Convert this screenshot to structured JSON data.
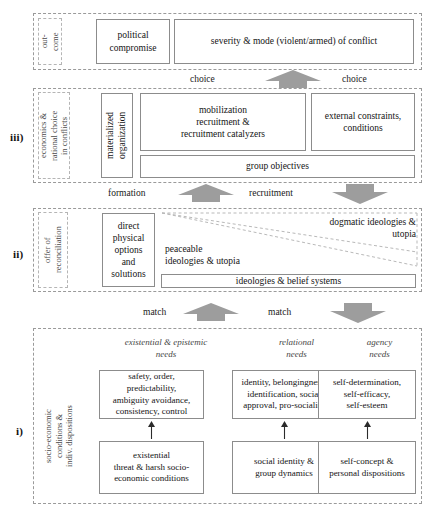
{
  "diagram": {
    "accent_arrow_color": "#9d9d9d",
    "band_border_color": "#9a9a9a",
    "box_border_color": "#8c8c8c"
  },
  "tiers": {
    "iii_label": "iii)",
    "ii_label": "ii)",
    "i_label": "i)"
  },
  "outcome": {
    "side_caption": "out-\ncome",
    "boxes": [
      {
        "id": "political-compromise",
        "label": "political\ncompromise"
      },
      {
        "id": "severity-mode",
        "label": "severity & mode (violent/armed) of conflict"
      }
    ]
  },
  "economics": {
    "side_caption": "economics &\nrational choice\nin conflicts",
    "boxes": [
      {
        "id": "materialized-organization",
        "label": "materialized\norganization"
      },
      {
        "id": "mobilization",
        "label": "mobilization\nrecruitment &\nrecruitment catalyzers"
      },
      {
        "id": "external-constraints",
        "label": "external constraints,\nconditions"
      },
      {
        "id": "group-objectives",
        "label": "group objectives"
      }
    ]
  },
  "reconciliation": {
    "side_caption": "offer of\nreconciliation",
    "boxes": [
      {
        "id": "direct-physical-options",
        "label": "direct\nphysical\noptions\nand\nsolutions"
      },
      {
        "id": "ideologies-belief-systems",
        "label": "ideologies & belief systems"
      }
    ],
    "free_text": [
      {
        "id": "dogmatic",
        "label": "dogmatic ideologies &\nutopia"
      },
      {
        "id": "peaceable",
        "label": "peaceable\nideologies & utopia"
      }
    ]
  },
  "socioeconomic": {
    "side_caption": "socio-economic\nconditions &\nindiv. dispositions",
    "need_headers": [
      {
        "id": "existential-epistemic-needs",
        "label": "existential & epistemic\nneeds"
      },
      {
        "id": "relational-needs",
        "label": "relational\nneeds"
      },
      {
        "id": "agency-needs",
        "label": "agency\nneeds"
      }
    ],
    "upper_boxes": [
      {
        "id": "safety-order",
        "label": "safety, order,\npredictability,\nambiguity avoidance,\nconsistency, control"
      },
      {
        "id": "identity-belongingness",
        "label": "identity, belongingness,\nidentification, social\napproval, pro-sociality"
      },
      {
        "id": "self-determination",
        "label": "self-determination,\nself-efficacy,\nself-esteem"
      }
    ],
    "lower_boxes": [
      {
        "id": "existential-threat",
        "label": "existential\nthreat & harsh socio-\neconomic conditions"
      },
      {
        "id": "social-identity",
        "label": "social identity &\ngroup dynamics"
      },
      {
        "id": "self-concept",
        "label": "self-concept &\npersonal dispositions"
      }
    ]
  },
  "connectors": [
    {
      "id": "choice-left",
      "label": "choice"
    },
    {
      "id": "choice-right",
      "label": "choice"
    },
    {
      "id": "formation",
      "label": "formation"
    },
    {
      "id": "recruitment",
      "label": "recruitment"
    },
    {
      "id": "match-left",
      "label": "match"
    },
    {
      "id": "match-right",
      "label": "match"
    }
  ]
}
